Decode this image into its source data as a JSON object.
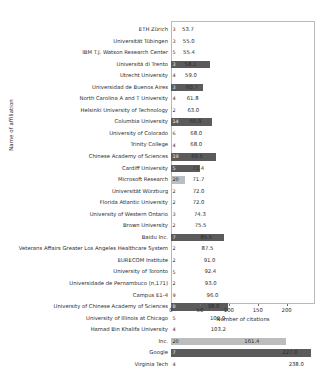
{
  "chart_data": {
    "type": "bar",
    "orientation": "horizontal",
    "title": "",
    "xlabel": "Number of citations",
    "ylabel": "Name of affiliation",
    "xlim": [
      0,
      249
    ],
    "xticks": [
      0,
      50,
      100,
      150,
      200
    ],
    "grid": false,
    "legend": null,
    "bar_color": "#5b5b5b",
    "highlight_color": "#bdbdbd",
    "categories": [
      "ETH Zürich",
      "Universität Tübingen",
      "IBM T.J. Watson Research Center",
      "Università di Trento",
      "Utrecht University",
      "Universidad de Buenos Aires",
      "North Carolina A and T University",
      "Helsinki University of Technology",
      "Columbia University",
      "University of Colorado",
      "Trinity College",
      "Chinese Academy of Sciences",
      "Cardiff University",
      "Microsoft Research",
      "Universität Würzburg",
      "Florida Atlantic University",
      "University of Western Ontario",
      "Brown University",
      "Baidu Inc.",
      "Veterans Affairs Greater Los Angeles Healthcare System",
      "EURECOM Institute",
      "University of Toronto",
      "Universidade de Pernambuco (n,171)",
      "Campus E1-4",
      "University of Chinese Academy of Sciences",
      "University of Illinois at Chicago",
      "Hamad Bin Khalifa University",
      "Inc.",
      "Google",
      "Virginia Tech"
    ],
    "values": [
      53.7,
      55.0,
      55.4,
      58.1,
      59.0,
      60.7,
      61.8,
      63.0,
      66.9,
      68.0,
      68.0,
      69.5,
      71.4,
      71.7,
      72.0,
      72.0,
      74.3,
      75.5,
      85.5,
      87.5,
      91.0,
      92.4,
      93.0,
      96.0,
      98.0,
      102.0,
      103.2,
      161.4,
      227.0,
      238.0
    ],
    "counts": [
      3,
      3,
      5,
      3,
      4,
      3,
      4,
      2,
      14,
      6,
      4,
      19,
      5,
      20,
      2,
      2,
      3,
      2,
      7,
      2,
      2,
      5,
      2,
      9,
      8,
      5,
      4,
      20,
      7,
      4
    ],
    "bar_lengths": [
      0,
      0,
      0,
      39,
      0,
      32,
      0,
      0,
      41,
      0,
      0,
      45,
      29,
      14,
      0,
      0,
      0,
      0,
      53,
      0,
      0,
      0,
      0,
      0,
      57,
      0,
      0,
      115,
      140,
      0
    ],
    "bar_styles": [
      "none",
      "none",
      "none",
      "dark",
      "none",
      "dark",
      "none",
      "none",
      "dark",
      "none",
      "none",
      "dark",
      "dark",
      "light",
      "none",
      "none",
      "none",
      "none",
      "dark",
      "none",
      "none",
      "none",
      "none",
      "none",
      "dark",
      "none",
      "none",
      "light",
      "dark",
      "none"
    ],
    "value_labels": [
      "53.7",
      "55.0",
      "55.4",
      "58.1",
      "59.0",
      "60.7",
      "61.8",
      "63.0",
      "66.9",
      "68.0",
      "68.0",
      "69.5",
      "71.4",
      "71.7",
      "72.0",
      "72.0",
      "74.3",
      "75.5",
      "85.5",
      "87.5",
      "91.0",
      "92.4",
      "93.0",
      "96.0",
      "98.0",
      "102.0",
      "103.2",
      "161.4",
      "227.0",
      "238.0"
    ],
    "count_labels": [
      "3",
      "3",
      "5",
      "3",
      "4",
      "3",
      "4",
      "2",
      "14",
      "6",
      "4",
      "19",
      "5",
      "20",
      "2",
      "2",
      "3",
      "2",
      "7",
      "2",
      "2",
      "5",
      "2",
      "9",
      "8",
      "5",
      "4",
      "20",
      "7",
      "4"
    ],
    "xtick_labels": [
      "0",
      "50",
      "100",
      "150",
      "200"
    ]
  }
}
